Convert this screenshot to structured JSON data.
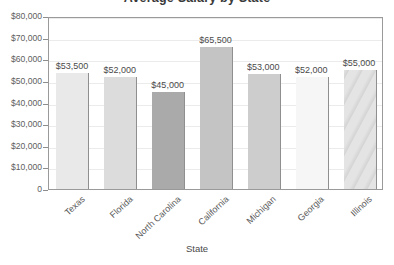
{
  "chart_data": {
    "type": "bar",
    "title": "Average Salary by State",
    "xlabel": "State",
    "ylabel": "",
    "categories": [
      "Texas",
      "Florida",
      "North Carolina",
      "California",
      "Michigan",
      "Georgia",
      "Illinois"
    ],
    "values": [
      53500,
      52000,
      45000,
      65500,
      53000,
      52000,
      55000
    ],
    "value_labels": [
      "$53,500",
      "$52,000",
      "$45,000",
      "$65,500",
      "$53,000",
      "$52,000",
      "$55,000"
    ],
    "ylim": [
      0,
      80000
    ],
    "ytick_values": [
      0,
      10000,
      20000,
      30000,
      40000,
      50000,
      60000,
      70000,
      80000
    ],
    "ytick_labels": [
      "0",
      "$10,000",
      "$20,000",
      "$30,000",
      "$40,000",
      "$50,000",
      "$60,000",
      "$70,000",
      "$80,000"
    ],
    "grid": true,
    "legend": false,
    "bar_colors": [
      "#e9e9e9",
      "#dcdcdc",
      "#aaaaaa",
      "#c4c4c4",
      "#cdcdcd",
      "#f6f6f6",
      "#e4e4e4"
    ],
    "bar_patterns": [
      "solid",
      "solid",
      "solid",
      "solid",
      "solid",
      "solid",
      "streaked"
    ],
    "axis_color": "#9a9a9a",
    "gridline_color": "#ebebeb",
    "text_color": "#5a5a5a",
    "background": "#ffffff"
  }
}
